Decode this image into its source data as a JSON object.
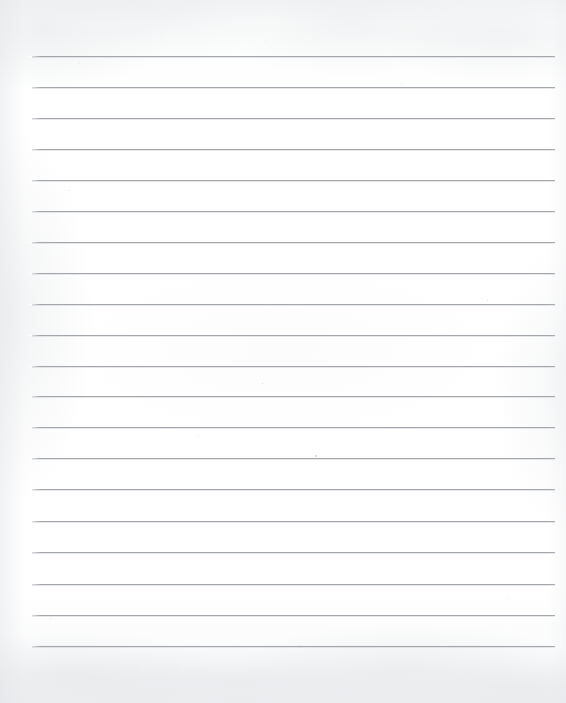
{
  "document": {
    "kind": "scanned-lined-notebook-paper",
    "title": "Blank Lined Paper",
    "text_content": "",
    "handwriting": "",
    "page_width_px": 566,
    "page_height_px": 703,
    "paper_color": "#fdfdfd",
    "background_color": "#ffffff",
    "rule_color": "#9a9ea3",
    "rule_count": 20,
    "rule_left_px": 32,
    "rule_right_px": 555,
    "rule_first_y_px": 56,
    "rule_spacing_px": 31,
    "rule_thickness_px": 1,
    "has_margin_line": false,
    "has_header": false,
    "has_holes": false,
    "rules": [
      {
        "index": 1,
        "y": 56,
        "left": 32,
        "right": 555
      },
      {
        "index": 2,
        "y": 87,
        "left": 32,
        "right": 555
      },
      {
        "index": 3,
        "y": 118,
        "left": 32,
        "right": 555
      },
      {
        "index": 4,
        "y": 149,
        "left": 32,
        "right": 555
      },
      {
        "index": 5,
        "y": 180,
        "left": 32,
        "right": 555
      },
      {
        "index": 6,
        "y": 211,
        "left": 32,
        "right": 555
      },
      {
        "index": 7,
        "y": 242,
        "left": 32,
        "right": 555
      },
      {
        "index": 8,
        "y": 273,
        "left": 32,
        "right": 555
      },
      {
        "index": 9,
        "y": 304,
        "left": 32,
        "right": 555
      },
      {
        "index": 10,
        "y": 335,
        "left": 32,
        "right": 555
      },
      {
        "index": 11,
        "y": 366,
        "left": 32,
        "right": 555
      },
      {
        "index": 12,
        "y": 396,
        "left": 32,
        "right": 555
      },
      {
        "index": 13,
        "y": 427,
        "left": 32,
        "right": 555
      },
      {
        "index": 14,
        "y": 458,
        "left": 32,
        "right": 555
      },
      {
        "index": 15,
        "y": 489,
        "left": 32,
        "right": 555
      },
      {
        "index": 16,
        "y": 521,
        "left": 32,
        "right": 555
      },
      {
        "index": 17,
        "y": 552,
        "left": 32,
        "right": 555
      },
      {
        "index": 18,
        "y": 584,
        "left": 32,
        "right": 555
      },
      {
        "index": 19,
        "y": 615,
        "left": 32,
        "right": 555
      },
      {
        "index": 20,
        "y": 646,
        "left": 32,
        "right": 555
      }
    ],
    "specks": [
      {
        "x": 315,
        "y": 455,
        "size": 2
      },
      {
        "x": 68,
        "y": 190,
        "size": 1
      },
      {
        "x": 262,
        "y": 383,
        "size": 1
      },
      {
        "x": 487,
        "y": 300,
        "size": 1
      }
    ]
  }
}
